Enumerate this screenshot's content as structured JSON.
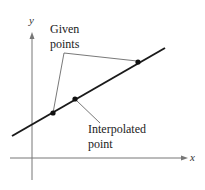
{
  "figure": {
    "type": "linear interpolation diagram",
    "axes": {
      "x_label": "x",
      "y_label": "y"
    },
    "annotations": {
      "given_points_line1": "Given",
      "given_points_line2": "points",
      "interpolated_line1": "Interpolated",
      "interpolated_line2": "point"
    },
    "line": {
      "x1": 12,
      "y1": 136,
      "x2": 165,
      "y2": 48
    },
    "given_points": [
      {
        "x": 53,
        "y": 113
      },
      {
        "x": 138,
        "y": 62
      }
    ],
    "interpolated_point": {
      "x": 75,
      "y": 99
    },
    "colors": {
      "line": "#1a1a1a",
      "axis": "#777777",
      "leader": "#555555",
      "point": "#111111"
    }
  }
}
